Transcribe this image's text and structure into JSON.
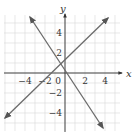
{
  "chart_data": {
    "type": "line",
    "title": "",
    "xlabel": "x",
    "ylabel": "y",
    "xlim": [
      -6,
      5.5
    ],
    "ylim": [
      -5.5,
      6
    ],
    "grid": true,
    "x_ticks": [
      -4,
      -2,
      0,
      2,
      4
    ],
    "y_ticks": [
      4,
      2,
      -2,
      -4
    ],
    "x_tick_labels": [
      "−4",
      "−2",
      "0",
      "2",
      "4"
    ],
    "y_tick_labels": [
      "4",
      "2",
      "−2",
      "−4"
    ],
    "series": [
      {
        "name": "line-increasing",
        "equation": "y = x + 1.5",
        "points": [
          [
            -6,
            -4.5
          ],
          [
            4.3,
            5.5
          ]
        ],
        "arrows": "both"
      },
      {
        "name": "line-decreasing",
        "equation": "y = -1.5x + 0.5",
        "points": [
          [
            -3.5,
            5.6
          ],
          [
            3.8,
            -5.5
          ]
        ],
        "arrows": "both"
      }
    ],
    "line_color": "#6b6b6b",
    "grid_color": "#d9d9d9",
    "axis_color": "#333333"
  }
}
